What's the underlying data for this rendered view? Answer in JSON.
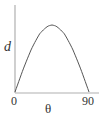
{
  "chart_data": {
    "type": "line",
    "title": "",
    "xlabel": "θ",
    "ylabel": "d",
    "x_ticks": [
      "0",
      "90"
    ],
    "xlim": [
      0,
      90
    ],
    "ylim": [
      0,
      1.1
    ],
    "grid": false,
    "legend": null,
    "series": [
      {
        "name": "d vs θ",
        "x": [
          0,
          10,
          20,
          30,
          40,
          45,
          50,
          60,
          70,
          80,
          90
        ],
        "values": [
          0,
          0.34,
          0.64,
          0.87,
          0.98,
          1.0,
          0.98,
          0.87,
          0.64,
          0.34,
          0
        ]
      }
    ]
  },
  "labels": {
    "y_axis": "d",
    "x_axis": "θ",
    "x_tick_start": "0",
    "x_tick_end": "90"
  },
  "colors": {
    "axis": "#b0b0b0",
    "curve": "#555555",
    "text": "#333333"
  }
}
